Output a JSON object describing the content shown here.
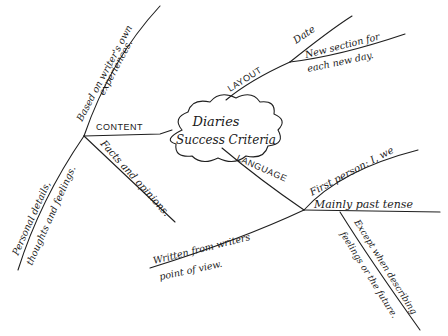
{
  "center": {
    "line1": "Diaries",
    "line2": "Success Criteria"
  },
  "branches": {
    "layout": {
      "label": "LAYOUT",
      "subs": [
        {
          "text": "Date"
        },
        {
          "line1": "New section for",
          "line2": "each new day."
        }
      ]
    },
    "content": {
      "label": "CONTENT",
      "subs": [
        {
          "line1": "Based on writer's own",
          "line2": "experiences."
        },
        {
          "text": "Facts and opinions."
        },
        {
          "line1": "Personal details,",
          "line2": "thoughts and feelings."
        }
      ]
    },
    "language": {
      "label": "LANGUAGE",
      "subs": [
        {
          "text": "First person: I, we"
        },
        {
          "text": "Mainly past tense"
        },
        {
          "line1": "Written from writers",
          "line2": "point of view."
        }
      ],
      "sub_sub": {
        "line1": "Except when describing",
        "line2": "feelings or the future."
      }
    }
  },
  "colors": {
    "ink": "#1f1f1f",
    "paper": "#ffffff"
  }
}
